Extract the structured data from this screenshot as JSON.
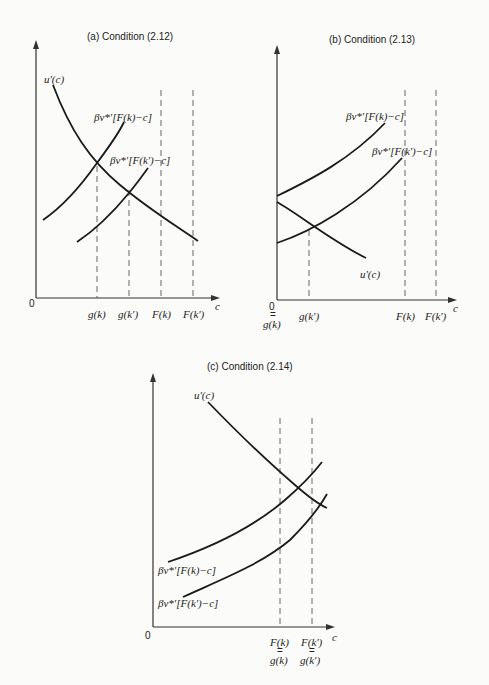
{
  "panels": [
    {
      "id": "a",
      "title": "(a) Condition (2.12)",
      "origin_label": "0",
      "x_axis_label": "c",
      "x_ticks": [
        "g(k)",
        "g(k')",
        "F(k)",
        "F(k')"
      ],
      "curves": [
        {
          "name": "u'(c)",
          "label": "u'(c)",
          "shape": "decreasing"
        },
        {
          "name": "bv_Fk",
          "label": "βv*'[F(k)−c]",
          "shape": "increasing"
        },
        {
          "name": "bv_Fkp",
          "label": "βv*'[F(k')−c]",
          "shape": "increasing"
        }
      ]
    },
    {
      "id": "b",
      "title": "(b) Condition (2.13)",
      "origin_label": "0",
      "origin_eq": "=",
      "origin_sub": "g(k)",
      "x_axis_label": "c",
      "x_ticks": [
        "g(k')",
        "F(k)",
        "F(k')"
      ],
      "curves": [
        {
          "name": "bv_Fk",
          "label": "βv*'[F(k)−c]",
          "shape": "increasing"
        },
        {
          "name": "bv_Fkp",
          "label": "βv*'[F(k')−c]",
          "shape": "increasing"
        },
        {
          "name": "u'(c)",
          "label": "u'(c)",
          "shape": "decreasing"
        }
      ]
    },
    {
      "id": "c",
      "title": "(c) Condition (2.14)",
      "origin_label": "0",
      "x_axis_label": "c",
      "x_ticks_top": [
        "F(k)",
        "F(k')"
      ],
      "x_ticks_eq": "=",
      "x_ticks_bottom": [
        "g(k)",
        "g(k')"
      ],
      "curves": [
        {
          "name": "u'(c)",
          "label": "u'(c)",
          "shape": "decreasing"
        },
        {
          "name": "bv_Fk",
          "label": "βv*'[F(k)−c]",
          "shape": "increasing"
        },
        {
          "name": "bv_Fkp",
          "label": "βv*'[F(k')−c]",
          "shape": "increasing"
        }
      ]
    }
  ]
}
